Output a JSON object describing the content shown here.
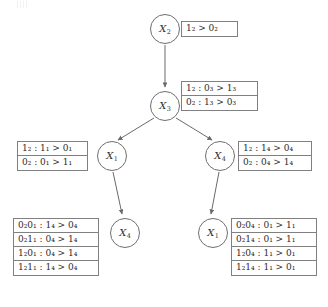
{
  "diagram": {
    "type": "decision-tree",
    "nodes": [
      {
        "id": "root",
        "label": "X",
        "sub": "2",
        "x": 150,
        "y": 14
      },
      {
        "id": "level1",
        "label": "X",
        "sub": "3",
        "x": 150,
        "y": 91
      },
      {
        "id": "level2-left",
        "label": "X",
        "sub": "1",
        "x": 97,
        "y": 141
      },
      {
        "id": "level2-right",
        "label": "X",
        "sub": "4",
        "x": 205,
        "y": 141
      },
      {
        "id": "leaf-left",
        "label": "X",
        "sub": "4",
        "x": 110,
        "y": 218
      },
      {
        "id": "leaf-right",
        "label": "X",
        "sub": "1",
        "x": 198,
        "y": 218
      }
    ],
    "edges": [
      {
        "from": "root",
        "to": "level1"
      },
      {
        "from": "level1",
        "to": "level2-left"
      },
      {
        "from": "level1",
        "to": "level2-right"
      },
      {
        "from": "level2-left",
        "to": "leaf-left"
      },
      {
        "from": "level2-right",
        "to": "leaf-right"
      }
    ],
    "tables": [
      {
        "id": "cpt-root",
        "x": 181,
        "y": 21,
        "width": 57,
        "rows": [
          {
            "left": "1",
            "leftsub": "2",
            "op": ">",
            "right": "0",
            "rightsub": "2",
            "text": "1₂ > 0₂"
          }
        ]
      },
      {
        "id": "cpt-level1",
        "x": 181,
        "y": 81,
        "width": 77,
        "rows": [
          {
            "text": "1₂ : 0₃ > 1₃"
          },
          {
            "text": "0₂ : 1₃ > 0₃"
          }
        ]
      },
      {
        "id": "cpt-level2-left",
        "x": 17,
        "y": 141,
        "width": 71,
        "rows": [
          {
            "text": "1₂ : 1₁ > 0₁"
          },
          {
            "text": "0₂ : 0₁ > 1₁"
          }
        ]
      },
      {
        "id": "cpt-level2-right",
        "x": 238,
        "y": 141,
        "width": 74,
        "rows": [
          {
            "text": "1₂ : 1₄ > 0₄"
          },
          {
            "text": "0₂ : 0₄ > 1₄"
          }
        ]
      },
      {
        "id": "cpt-leaf-left",
        "x": 13,
        "y": 218,
        "width": 86,
        "rows": [
          {
            "text": "0₂0₁ : 1₄ > 0₄"
          },
          {
            "text": "0₂1₁ : 0₄ > 1₄"
          },
          {
            "text": "1₂0₁ : 0₄ > 1₄"
          },
          {
            "text": "1₂1₁ : 1₄ > 0₄"
          }
        ]
      },
      {
        "id": "cpt-leaf-right",
        "x": 231,
        "y": 218,
        "width": 86,
        "rows": [
          {
            "text": "0₂0₄ : 0₁ > 1₁"
          },
          {
            "text": "0₂1₄ : 0₁ > 1₁"
          },
          {
            "text": "1₂0₄ : 1₁ > 0₁"
          },
          {
            "text": "1₂1₄ : 1₁ > 0₁"
          }
        ]
      }
    ],
    "colors": {
      "node_stroke": "#6f6f6f",
      "table_border": "#808080",
      "edge": "#707070",
      "text": "#2b2b2b",
      "background": "#ffffff"
    }
  }
}
